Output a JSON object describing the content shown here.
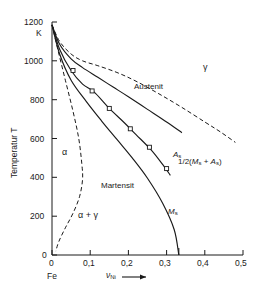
{
  "figure": {
    "background": "#ffffff",
    "line_color": "#1a1a1a"
  },
  "axes": {
    "y": {
      "label": "Temperatur T",
      "unit": "K",
      "ticks": [
        "0",
        "200",
        "400",
        "600",
        "800",
        "1000",
        "1200"
      ],
      "min": 0,
      "max": 1200
    },
    "x": {
      "label": "ν",
      "label_sub": "Ni",
      "arrow": "⟶",
      "origin_label": "Fe",
      "ticks": [
        "0",
        "0,1",
        "0,2",
        "0,3",
        "0,4",
        "0,5"
      ],
      "min": 0,
      "max": 0.5
    }
  },
  "labels": {
    "austenit": "Austenit",
    "martensit": "Martensit",
    "gamma": "γ",
    "alpha": "α",
    "alpha_gamma": "α + γ",
    "as_main": "A",
    "as_sub": "s",
    "ms_main": "M",
    "ms_sub": "s",
    "mid_prefix": "1/2(",
    "mid_m": "M",
    "mid_m_sub": "s",
    "mid_plus": " + ",
    "mid_a": "A",
    "mid_a_sub": "s",
    "mid_suffix": ")"
  },
  "chart_data": {
    "type": "line",
    "xlabel": "ν_Ni",
    "ylabel": "Temperatur T",
    "xlim": [
      0,
      0.5
    ],
    "ylim": [
      0,
      1200
    ],
    "xticks": [
      0,
      0.1,
      0.2,
      0.3,
      0.4,
      0.5
    ],
    "yticks": [
      0,
      200,
      400,
      600,
      800,
      1000,
      1200
    ],
    "grid": false,
    "legend": "none",
    "series": [
      {
        "name": "Austenit boundary (dashed, gamma/alpha+gamma upper)",
        "style": "dashed",
        "x": [
          0.0,
          0.02,
          0.05,
          0.08,
          0.12,
          0.17,
          0.22,
          0.28,
          0.34,
          0.4,
          0.44,
          0.48
        ],
        "y": [
          1185,
          1100,
          1035,
          1000,
          975,
          940,
          895,
          830,
          760,
          685,
          635,
          580
        ]
      },
      {
        "name": "A_s",
        "style": "solid",
        "x": [
          0.0,
          0.02,
          0.05,
          0.08,
          0.12,
          0.16,
          0.2,
          0.25,
          0.3,
          0.34
        ],
        "y": [
          1185,
          1085,
          1010,
          965,
          915,
          865,
          815,
          750,
          685,
          630
        ],
        "markers": [
          {
            "x": 0.055,
            "y": 950
          }
        ]
      },
      {
        "name": "1/2(M_s + A_s)",
        "style": "solid",
        "x": [
          0.0,
          0.02,
          0.05,
          0.08,
          0.11,
          0.15,
          0.19,
          0.22,
          0.26,
          0.29,
          0.31
        ],
        "y": [
          1185,
          1060,
          950,
          880,
          840,
          755,
          680,
          620,
          540,
          465,
          410
        ],
        "markers": [
          {
            "x": 0.105,
            "y": 845
          },
          {
            "x": 0.15,
            "y": 755
          },
          {
            "x": 0.205,
            "y": 650
          },
          {
            "x": 0.255,
            "y": 555
          },
          {
            "x": 0.3,
            "y": 445
          }
        ]
      },
      {
        "name": "M_s",
        "style": "solid",
        "x": [
          0.0,
          0.02,
          0.05,
          0.09,
          0.13,
          0.17,
          0.21,
          0.25,
          0.29,
          0.32,
          0.332
        ],
        "y": [
          1185,
          1035,
          900,
          790,
          690,
          595,
          500,
          395,
          265,
          130,
          0
        ]
      },
      {
        "name": "alpha phase boundary (dashed, left)",
        "style": "dashed",
        "x": [
          0.0,
          0.015,
          0.035,
          0.055,
          0.07,
          0.078,
          0.08,
          0.072,
          0.055,
          0.035,
          0.018,
          0.01
        ],
        "y": [
          1185,
          1060,
          900,
          740,
          600,
          470,
          390,
          300,
          215,
          140,
          70,
          20
        ]
      }
    ],
    "annotations": [
      {
        "text": "Austenit",
        "x": 0.2,
        "y": 880
      },
      {
        "text": "γ",
        "x": 0.4,
        "y": 970
      },
      {
        "text": "A_s",
        "x": 0.315,
        "y": 630
      },
      {
        "text": "1/2(M_s + A_s)",
        "x": 0.325,
        "y": 450
      },
      {
        "text": "Martensit",
        "x": 0.145,
        "y": 370
      },
      {
        "text": "M_s",
        "x": 0.305,
        "y": 175
      },
      {
        "text": "α",
        "x": 0.035,
        "y": 455
      },
      {
        "text": "α + γ",
        "x": 0.085,
        "y": 165
      },
      {
        "text": "Fe",
        "x": 0.0,
        "y": -110
      }
    ]
  }
}
